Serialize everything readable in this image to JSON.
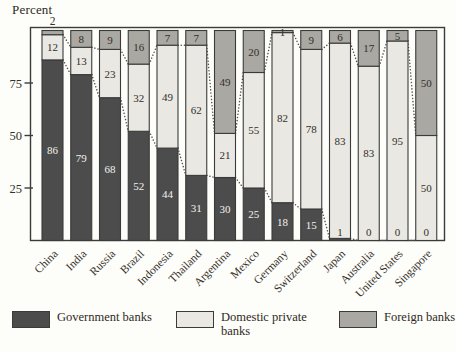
{
  "chart_data": {
    "type": "bar",
    "stacked": true,
    "title": "",
    "ylabel": "Percent",
    "xlabel": "",
    "ylim": [
      0,
      100
    ],
    "yticks": [
      25,
      50,
      75
    ],
    "grid": false,
    "legend_position": "bottom",
    "bar_outline_color": "#3b3b3b",
    "connector_style": "dotted",
    "categories": [
      "China",
      "India",
      "Russia",
      "Brazil",
      "Indonesia",
      "Thailand",
      "Argentina",
      "Mexico",
      "Germany",
      "Switzerland",
      "Japan",
      "Australia",
      "United States",
      "Singapore"
    ],
    "series": [
      {
        "name": "Government banks",
        "color": "#4c4c4c",
        "label_color": "#f3f1ec",
        "values": [
          86,
          79,
          68,
          52,
          44,
          31,
          30,
          25,
          18,
          15,
          1,
          0,
          0,
          0
        ]
      },
      {
        "name": "Domestic private banks",
        "color": "#e9e8e2",
        "label_color": "#332f29",
        "values": [
          12,
          13,
          23,
          32,
          49,
          62,
          21,
          55,
          82,
          78,
          83,
          83,
          95,
          50
        ]
      },
      {
        "name": "Foreign banks",
        "color": "#a9a8a2",
        "label_color": "#332f29",
        "values": [
          2,
          8,
          9,
          16,
          7,
          7,
          49,
          20,
          1,
          9,
          6,
          17,
          5,
          50
        ]
      }
    ],
    "outside_value_labels": [
      {
        "category": "China",
        "series": "Foreign banks",
        "text": "2"
      }
    ]
  }
}
